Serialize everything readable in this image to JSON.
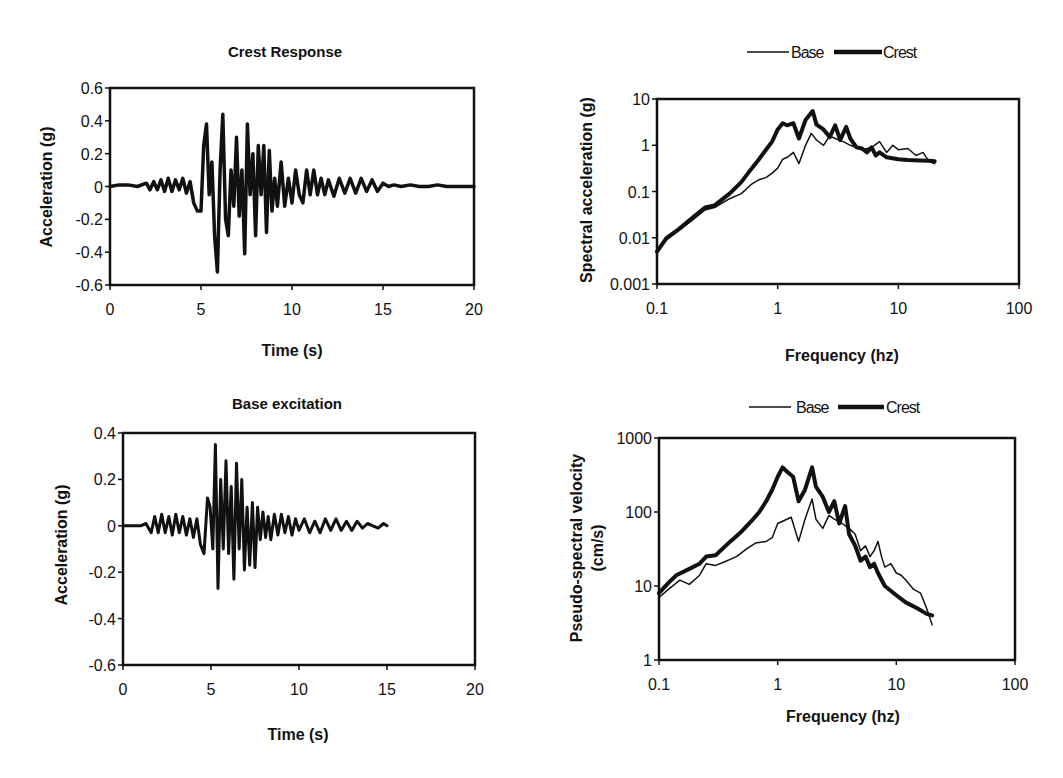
{
  "chart_data": [
    {
      "id": "crest_response",
      "type": "line",
      "title": "Crest Response",
      "xlabel": "Time (s)",
      "ylabel": "Acceleration (g)",
      "xlim": [
        0,
        20
      ],
      "ylim": [
        -0.6,
        0.6
      ],
      "xticks": [
        "0",
        "5",
        "10",
        "15",
        "20"
      ],
      "yticks": [
        "0.6",
        "0.4",
        "0.2",
        "0",
        "-0.2",
        "-0.4",
        "-0.6"
      ],
      "grid": false,
      "legend": null,
      "series": [
        {
          "name": "Crest acceleration",
          "line_width": 3.5,
          "x": [
            0,
            0.5,
            1,
            1.5,
            2,
            2.2,
            2.4,
            2.6,
            2.8,
            3,
            3.2,
            3.4,
            3.6,
            3.8,
            4,
            4.2,
            4.4,
            4.6,
            4.8,
            5,
            5.15,
            5.3,
            5.45,
            5.6,
            5.75,
            5.9,
            6.05,
            6.2,
            6.35,
            6.5,
            6.65,
            6.8,
            6.95,
            7.1,
            7.25,
            7.4,
            7.55,
            7.7,
            7.85,
            8,
            8.15,
            8.3,
            8.45,
            8.6,
            8.75,
            8.9,
            9.05,
            9.2,
            9.4,
            9.6,
            9.8,
            10,
            10.2,
            10.4,
            10.6,
            10.8,
            11,
            11.2,
            11.4,
            11.6,
            11.8,
            12,
            12.3,
            12.6,
            12.9,
            13.2,
            13.5,
            13.8,
            14.1,
            14.4,
            14.7,
            15,
            15.3,
            15.6,
            16,
            16.5,
            17,
            17.5,
            18,
            18.5,
            19,
            19.5,
            20
          ],
          "y": [
            0,
            0.01,
            0.01,
            0,
            0.02,
            -0.02,
            0.03,
            -0.02,
            0.04,
            -0.03,
            0.05,
            -0.03,
            0.04,
            -0.02,
            0.05,
            -0.04,
            0.03,
            -0.1,
            -0.15,
            -0.15,
            0.25,
            0.38,
            -0.05,
            0.15,
            -0.3,
            -0.52,
            0.1,
            0.44,
            -0.2,
            -0.3,
            0.1,
            -0.12,
            0.3,
            -0.18,
            0.1,
            -0.41,
            0.38,
            -0.05,
            0.2,
            -0.3,
            0.25,
            -0.05,
            0.25,
            -0.28,
            0.22,
            -0.15,
            0.05,
            -0.12,
            0.15,
            -0.12,
            0.05,
            -0.1,
            0.1,
            -0.05,
            -0.1,
            0.1,
            -0.05,
            0.1,
            -0.05,
            0.05,
            -0.05,
            0.04,
            -0.06,
            0.05,
            -0.04,
            0.05,
            -0.04,
            0.05,
            -0.03,
            0.04,
            -0.03,
            0.02,
            0,
            0.01,
            0,
            0.01,
            0,
            0,
            0.01,
            0,
            0,
            0,
            0
          ]
        }
      ]
    },
    {
      "id": "base_excitation",
      "type": "line",
      "title": "Base excitation",
      "xlabel": "Time (s)",
      "ylabel": "Acceleration (g)",
      "xlim": [
        0,
        20
      ],
      "ylim": [
        -0.6,
        0.4
      ],
      "xticks": [
        "0",
        "5",
        "10",
        "15",
        "20"
      ],
      "yticks": [
        "0.4",
        "0.2",
        "0",
        "-0.2",
        "-0.4",
        "-0.6"
      ],
      "grid": false,
      "legend": null,
      "series": [
        {
          "name": "Base acceleration",
          "line_width": 3,
          "x": [
            0,
            1,
            1.3,
            1.6,
            1.8,
            2,
            2.2,
            2.4,
            2.6,
            2.8,
            3,
            3.2,
            3.4,
            3.6,
            3.8,
            4,
            4.2,
            4.4,
            4.6,
            4.8,
            4.95,
            5.1,
            5.25,
            5.4,
            5.55,
            5.7,
            5.85,
            6,
            6.15,
            6.3,
            6.45,
            6.6,
            6.75,
            6.9,
            7.05,
            7.2,
            7.35,
            7.5,
            7.65,
            7.8,
            7.95,
            8.1,
            8.25,
            8.4,
            8.6,
            8.8,
            9,
            9.2,
            9.4,
            9.6,
            9.8,
            10,
            10.3,
            10.6,
            10.9,
            11.2,
            11.5,
            11.8,
            12.1,
            12.4,
            12.7,
            13,
            13.3,
            13.6,
            13.9,
            14.2,
            14.5,
            14.8,
            15
          ],
          "y": [
            0,
            0,
            0.01,
            -0.03,
            0.04,
            -0.03,
            0.05,
            -0.03,
            0.04,
            -0.04,
            0.05,
            -0.03,
            0.04,
            -0.04,
            0.03,
            -0.05,
            0.03,
            -0.08,
            -0.12,
            0.12,
            0.08,
            -0.1,
            0.35,
            -0.27,
            0.2,
            -0.1,
            0.28,
            -0.12,
            0.17,
            -0.23,
            0.27,
            -0.1,
            0.2,
            -0.19,
            0.08,
            -0.17,
            0.1,
            -0.18,
            0.08,
            -0.06,
            0.06,
            -0.05,
            0.04,
            -0.06,
            0.05,
            -0.04,
            0.05,
            -0.03,
            0.04,
            -0.04,
            0.03,
            -0.02,
            0.03,
            -0.03,
            0.02,
            -0.03,
            0.03,
            -0.02,
            0.03,
            -0.02,
            0.02,
            -0.02,
            0.02,
            -0.01,
            0.01,
            0,
            -0.01,
            0.01,
            0
          ]
        }
      ]
    },
    {
      "id": "spectral_acceleration",
      "type": "line",
      "title": "",
      "xlabel": "Frequency (hz)",
      "ylabel": "Spectral acceleration (g)",
      "xscale": "log",
      "yscale": "log",
      "xlim": [
        0.1,
        100
      ],
      "ylim": [
        0.001,
        10
      ],
      "xticks": [
        "0.1",
        "1",
        "10",
        "100"
      ],
      "yticks": [
        "10",
        "1",
        "0.1",
        "0.01",
        "0.001"
      ],
      "grid": false,
      "legend": {
        "position": "top",
        "entries": [
          "Base",
          "Crest"
        ]
      },
      "series": [
        {
          "name": "Base",
          "line_width": 1.5,
          "x": [
            0.1,
            0.12,
            0.15,
            0.2,
            0.25,
            0.3,
            0.4,
            0.5,
            0.6,
            0.7,
            0.8,
            0.9,
            1.0,
            1.1,
            1.2,
            1.35,
            1.5,
            1.7,
            1.9,
            2.1,
            2.4,
            2.7,
            3.0,
            3.5,
            4.0,
            5.0,
            6.0,
            7.0,
            8.0,
            9.0,
            10,
            12,
            14,
            16,
            18,
            20
          ],
          "y": [
            0.005,
            0.009,
            0.014,
            0.025,
            0.04,
            0.045,
            0.07,
            0.09,
            0.14,
            0.18,
            0.2,
            0.25,
            0.32,
            0.5,
            0.55,
            0.7,
            0.4,
            1.0,
            1.8,
            1.3,
            1.0,
            1.6,
            1.4,
            1.2,
            1.0,
            0.8,
            0.9,
            1.2,
            0.7,
            1.0,
            0.8,
            0.85,
            0.6,
            0.7,
            0.45,
            0.4
          ]
        },
        {
          "name": "Crest",
          "line_width": 4,
          "x": [
            0.1,
            0.12,
            0.15,
            0.2,
            0.25,
            0.3,
            0.4,
            0.5,
            0.6,
            0.7,
            0.8,
            0.9,
            1.0,
            1.1,
            1.2,
            1.35,
            1.5,
            1.7,
            1.95,
            2.1,
            2.4,
            2.7,
            3.0,
            3.3,
            3.7,
            4.0,
            4.5,
            5.0,
            5.5,
            6.0,
            6.5,
            7.0,
            8.0,
            10,
            12,
            15,
            18,
            20
          ],
          "y": [
            0.005,
            0.01,
            0.015,
            0.028,
            0.045,
            0.05,
            0.09,
            0.16,
            0.3,
            0.5,
            0.8,
            1.2,
            2.2,
            3.0,
            2.7,
            3.0,
            1.4,
            3.5,
            5.5,
            2.8,
            2.2,
            1.5,
            2.7,
            1.3,
            2.5,
            1.4,
            0.9,
            0.85,
            0.7,
            0.9,
            0.6,
            0.7,
            0.55,
            0.5,
            0.48,
            0.47,
            0.46,
            0.45
          ]
        }
      ]
    },
    {
      "id": "pseudo_spectral_velocity",
      "type": "line",
      "title": "",
      "xlabel": "Frequency (hz)",
      "ylabel": "Pseudo-spectral velocity (cm/s)",
      "xscale": "log",
      "yscale": "log",
      "xlim": [
        0.1,
        100
      ],
      "ylim": [
        1,
        1000
      ],
      "xticks": [
        "0.1",
        "1",
        "10",
        "100"
      ],
      "yticks": [
        "1000",
        "100",
        "10",
        "1"
      ],
      "grid": false,
      "legend": {
        "position": "top",
        "entries": [
          "Base",
          "Crest"
        ]
      },
      "series": [
        {
          "name": "Base",
          "line_width": 1.5,
          "x": [
            0.1,
            0.12,
            0.15,
            0.18,
            0.22,
            0.25,
            0.3,
            0.35,
            0.45,
            0.55,
            0.65,
            0.8,
            0.9,
            1.0,
            1.1,
            1.3,
            1.5,
            1.7,
            1.95,
            2.1,
            2.4,
            2.7,
            3.0,
            3.5,
            4.0,
            4.5,
            5.0,
            5.5,
            6.0,
            6.5,
            7.0,
            7.5,
            8.0,
            9.0,
            10,
            11,
            12,
            14,
            16,
            18,
            20
          ],
          "y": [
            7,
            9,
            12,
            10.5,
            14,
            20,
            19,
            21,
            25,
            32,
            38,
            40,
            45,
            70,
            75,
            85,
            40,
            80,
            150,
            80,
            60,
            90,
            80,
            70,
            60,
            50,
            30,
            35,
            25,
            30,
            40,
            25,
            18,
            20,
            15,
            14,
            12,
            9,
            8,
            5,
            3
          ]
        },
        {
          "name": "Crest",
          "line_width": 4,
          "x": [
            0.1,
            0.12,
            0.14,
            0.18,
            0.22,
            0.25,
            0.3,
            0.4,
            0.5,
            0.6,
            0.7,
            0.8,
            0.9,
            1.0,
            1.1,
            1.2,
            1.35,
            1.5,
            1.7,
            1.95,
            2.1,
            2.4,
            2.7,
            3.0,
            3.3,
            3.7,
            4.0,
            4.5,
            5.0,
            5.5,
            6.0,
            6.5,
            7.0,
            8.0,
            10,
            12,
            15,
            18,
            20
          ],
          "y": [
            8,
            11,
            14,
            17,
            20,
            25,
            26,
            40,
            55,
            75,
            100,
            140,
            200,
            300,
            400,
            350,
            300,
            140,
            200,
            400,
            220,
            160,
            100,
            140,
            70,
            120,
            50,
            35,
            22,
            25,
            18,
            20,
            15,
            10,
            7.5,
            6,
            5,
            4.2,
            4
          ]
        }
      ]
    }
  ],
  "legend_labels": {
    "base": "Base",
    "crest": "Crest"
  }
}
